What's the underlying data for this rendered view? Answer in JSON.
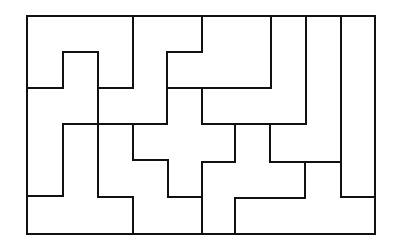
{
  "diagram": {
    "type": "polyomino-tiling",
    "grid": {
      "cols": 10,
      "rows": 6
    },
    "stroke_color": "#111111",
    "background": "#ffffff",
    "outer": {
      "x": 27,
      "y": 16,
      "w": 348,
      "h": 218
    },
    "segments": [
      [
        133,
        16,
        133,
        88
      ],
      [
        27,
        88,
        63,
        88
      ],
      [
        63,
        52,
        63,
        88
      ],
      [
        63,
        52,
        98,
        52
      ],
      [
        98,
        52,
        98,
        197
      ],
      [
        98,
        88,
        133,
        88
      ],
      [
        167,
        52,
        167,
        124
      ],
      [
        167,
        52,
        202,
        52
      ],
      [
        202,
        16,
        202,
        52
      ],
      [
        167,
        88,
        271,
        88
      ],
      [
        271,
        16,
        271,
        88
      ],
      [
        202,
        88,
        202,
        124
      ],
      [
        202,
        124,
        306,
        124
      ],
      [
        306,
        16,
        306,
        124
      ],
      [
        341,
        16,
        341,
        197
      ],
      [
        341,
        197,
        375,
        197
      ],
      [
        63,
        124,
        167,
        124
      ],
      [
        63,
        124,
        63,
        196
      ],
      [
        27,
        196,
        63,
        196
      ],
      [
        133,
        124,
        133,
        160
      ],
      [
        133,
        160,
        168,
        160
      ],
      [
        168,
        160,
        168,
        197
      ],
      [
        98,
        197,
        133,
        197
      ],
      [
        133,
        197,
        133,
        234
      ],
      [
        235,
        124,
        235,
        162
      ],
      [
        202,
        162,
        235,
        162
      ],
      [
        202,
        162,
        202,
        234
      ],
      [
        270,
        124,
        270,
        162
      ],
      [
        270,
        162,
        341,
        162
      ],
      [
        305,
        162,
        305,
        198
      ],
      [
        235,
        198,
        305,
        198
      ],
      [
        235,
        198,
        235,
        234
      ],
      [
        168,
        197,
        202,
        197
      ]
    ]
  }
}
